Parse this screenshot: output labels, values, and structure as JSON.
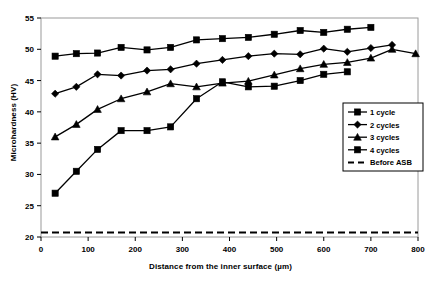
{
  "chart_data": {
    "type": "line",
    "title": "",
    "xlabel": "Distance from the inner surface (µm)",
    "ylabel": "Microhardness (HV)",
    "xlim": [
      0,
      800
    ],
    "ylim": [
      20,
      55
    ],
    "xticks": [
      0,
      100,
      200,
      300,
      400,
      500,
      600,
      700,
      800
    ],
    "yticks": [
      20,
      25,
      30,
      35,
      40,
      45,
      50,
      55
    ],
    "xtick_labels": [
      "0",
      "100",
      "200",
      "300",
      "400",
      "500",
      "600",
      "700",
      "800"
    ],
    "ytick_labels": [
      "20",
      "25",
      "30",
      "35",
      "40",
      "45",
      "50",
      "55"
    ],
    "grid": false,
    "legend_position": "right-lower",
    "series": [
      {
        "name": "1 cycle",
        "marker": "square",
        "color": "#000000",
        "style": "solid",
        "x": [
          30,
          75,
          120,
          170,
          225,
          275,
          330,
          385,
          440,
          495,
          550,
          600,
          650,
          700
        ],
        "y": [
          48.9,
          49.3,
          49.4,
          50.3,
          49.9,
          50.3,
          51.5,
          51.7,
          51.9,
          52.4,
          53.0,
          52.7,
          53.2,
          53.5
        ]
      },
      {
        "name": "2 cycles",
        "marker": "diamond",
        "color": "#000000",
        "style": "solid",
        "x": [
          30,
          75,
          120,
          170,
          225,
          275,
          330,
          385,
          440,
          495,
          550,
          600,
          650,
          700,
          745
        ],
        "y": [
          42.9,
          44.0,
          46.0,
          45.8,
          46.6,
          46.8,
          47.7,
          48.3,
          48.9,
          49.3,
          49.2,
          50.1,
          49.6,
          50.2,
          50.7
        ]
      },
      {
        "name": "3 cycles",
        "marker": "triangle",
        "color": "#000000",
        "style": "solid",
        "x": [
          30,
          75,
          120,
          170,
          225,
          275,
          330,
          385,
          440,
          495,
          550,
          600,
          650,
          700,
          745,
          795
        ],
        "y": [
          36.0,
          38.0,
          40.4,
          42.1,
          43.2,
          44.5,
          44.0,
          44.6,
          44.9,
          45.9,
          46.9,
          47.6,
          47.9,
          48.6,
          50.0,
          49.3
        ]
      },
      {
        "name": "4 cycles",
        "marker": "square",
        "color": "#000000",
        "style": "solid",
        "x": [
          30,
          75,
          120,
          170,
          225,
          275,
          330,
          385,
          440,
          495,
          550,
          600,
          650
        ],
        "y": [
          27.0,
          30.5,
          34.0,
          37.0,
          37.0,
          37.6,
          42.1,
          44.8,
          44.0,
          44.1,
          45.0,
          46.0,
          46.4
        ]
      }
    ],
    "reference_line": {
      "name": "Before ASB",
      "value": 20.7,
      "style": "dashed",
      "color": "#000000"
    },
    "legend_entries": [
      {
        "label": "1 cycle",
        "marker": "square",
        "style": "solid"
      },
      {
        "label": "2 cycles",
        "marker": "diamond",
        "style": "solid"
      },
      {
        "label": "3 cycles",
        "marker": "triangle",
        "style": "solid"
      },
      {
        "label": "4 cycles",
        "marker": "square",
        "style": "solid"
      },
      {
        "label": "Before ASB",
        "marker": "none",
        "style": "dashed"
      }
    ]
  }
}
